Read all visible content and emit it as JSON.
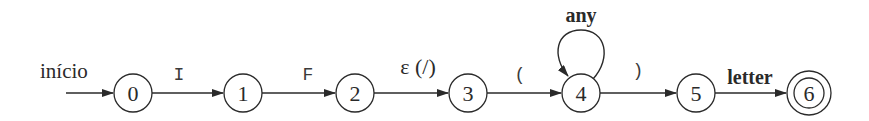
{
  "diagram": {
    "type": "finite-automaton",
    "start_label": "início",
    "colors": {
      "stroke": "#2a2a2a",
      "background": "#ffffff"
    },
    "states": [
      {
        "id": "0",
        "label": "0",
        "accepting": false
      },
      {
        "id": "1",
        "label": "1",
        "accepting": false
      },
      {
        "id": "2",
        "label": "2",
        "accepting": false
      },
      {
        "id": "3",
        "label": "3",
        "accepting": false
      },
      {
        "id": "4",
        "label": "4",
        "accepting": false
      },
      {
        "id": "5",
        "label": "5",
        "accepting": false
      },
      {
        "id": "6",
        "label": "6",
        "accepting": true
      }
    ],
    "transitions": [
      {
        "from": "0",
        "to": "1",
        "label": "I"
      },
      {
        "from": "1",
        "to": "2",
        "label": "F"
      },
      {
        "from": "2",
        "to": "3",
        "label": "ε (/)"
      },
      {
        "from": "3",
        "to": "4",
        "label": "("
      },
      {
        "from": "4",
        "to": "4",
        "label": "any"
      },
      {
        "from": "4",
        "to": "5",
        "label": ")"
      },
      {
        "from": "5",
        "to": "6",
        "label": "letter"
      }
    ]
  }
}
